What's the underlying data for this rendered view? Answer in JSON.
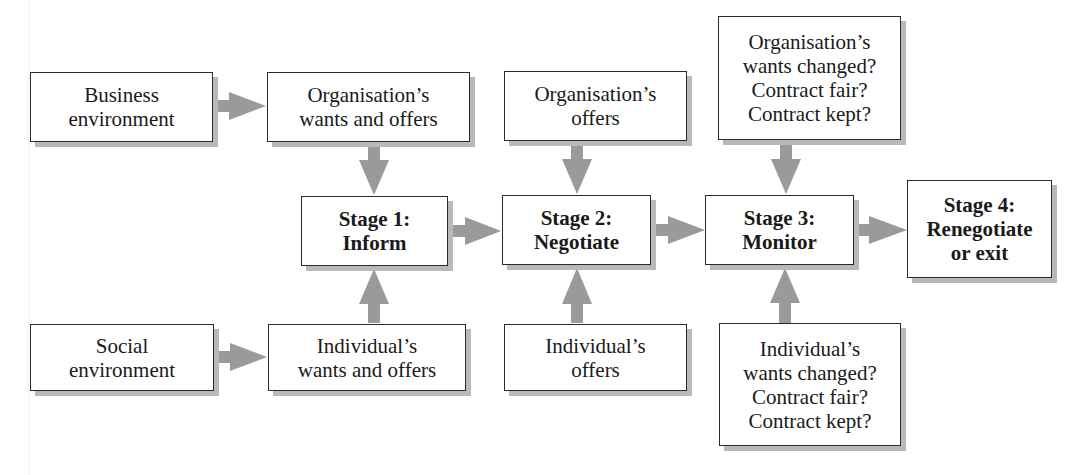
{
  "diagram": {
    "type": "flowchart",
    "inputs_top": {
      "business_environment": [
        "Business",
        "environment"
      ],
      "organisation_wants_offers": [
        "Organisation’s",
        "wants and offers"
      ],
      "organisation_offers": [
        "Organisation’s",
        "offers"
      ],
      "organisation_review": [
        "Organisation’s",
        "wants changed?",
        "Contract fair?",
        "Contract kept?"
      ]
    },
    "stages": {
      "stage1": [
        "Stage 1:",
        "Inform"
      ],
      "stage2": [
        "Stage 2:",
        "Negotiate"
      ],
      "stage3": [
        "Stage 3:",
        "Monitor"
      ],
      "stage4": [
        "Stage 4:",
        "Renegotiate",
        "or exit"
      ]
    },
    "inputs_bottom": {
      "social_environment": [
        "Social",
        "environment"
      ],
      "individual_wants_offers": [
        "Individual’s",
        "wants and offers"
      ],
      "individual_offers": [
        "Individual’s",
        "offers"
      ],
      "individual_review": [
        "Individual’s",
        "wants changed?",
        "Contract fair?",
        "Contract kept?"
      ]
    },
    "colors": {
      "arrow": "#9a9a9a",
      "border": "#2a2a2a",
      "shadow": "#b9b9b9"
    },
    "edges": [
      [
        "Business environment",
        "Organisation’s wants and offers"
      ],
      [
        "Social environment",
        "Individual’s wants and offers"
      ],
      [
        "Organisation’s wants and offers",
        "Stage 1: Inform"
      ],
      [
        "Individual’s wants and offers",
        "Stage 1: Inform"
      ],
      [
        "Organisation’s offers",
        "Stage 2: Negotiate"
      ],
      [
        "Individual’s offers",
        "Stage 2: Negotiate"
      ],
      [
        "Organisation’s wants changed? Contract fair? Contract kept?",
        "Stage 3: Monitor"
      ],
      [
        "Individual’s wants changed? Contract fair? Contract kept?",
        "Stage 3: Monitor"
      ],
      [
        "Stage 1: Inform",
        "Stage 2: Negotiate"
      ],
      [
        "Stage 2: Negotiate",
        "Stage 3: Monitor"
      ],
      [
        "Stage 3: Monitor",
        "Stage 4: Renegotiate or exit"
      ]
    ]
  }
}
